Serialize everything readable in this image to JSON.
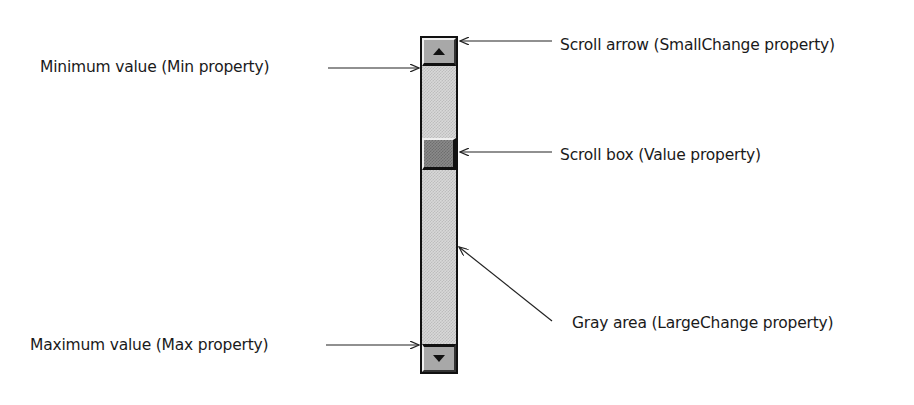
{
  "diagram": {
    "labels": {
      "min": "Minimum value (Min property)",
      "max": "Maximum value (Max property)",
      "scroll_arrow": "Scroll arrow (SmallChange property)",
      "scroll_box": "Scroll box (Value property)",
      "gray_area": "Gray area (LargeChange property)"
    },
    "scrollbar": {
      "orientation": "vertical",
      "up_arrow_icon": "triangle-up",
      "down_arrow_icon": "triangle-down"
    }
  }
}
